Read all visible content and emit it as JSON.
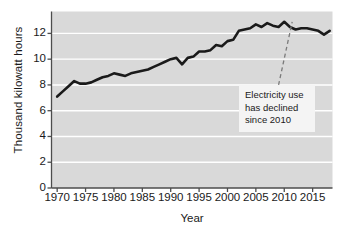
{
  "chart_data": {
    "type": "line",
    "title": "",
    "xlabel": "Year",
    "ylabel": "Thousand kilowatt hours",
    "xlim": [
      1969,
      2018.5
    ],
    "ylim": [
      0,
      13.7
    ],
    "grid": true,
    "legend": "none",
    "xticks": [
      1970,
      1975,
      1980,
      1985,
      1990,
      1995,
      2000,
      2005,
      2010,
      2015
    ],
    "xtick_labels": [
      "1970",
      "1975",
      "1980",
      "1985",
      "1990",
      "1995",
      "2000",
      "2005",
      "2010",
      "2015"
    ],
    "yticks": [
      0,
      2,
      4,
      6,
      8,
      10,
      12
    ],
    "ytick_labels": [
      "0",
      "2",
      "4",
      "6",
      "8",
      "10",
      "12"
    ],
    "series": [
      {
        "name": "Residential electricity use",
        "color": "#1a1a1a",
        "x": [
          1970,
          1971,
          1972,
          1973,
          1974,
          1975,
          1976,
          1977,
          1978,
          1979,
          1980,
          1981,
          1982,
          1983,
          1984,
          1985,
          1986,
          1987,
          1988,
          1989,
          1990,
          1991,
          1992,
          1993,
          1994,
          1995,
          1996,
          1997,
          1998,
          1999,
          2000,
          2001,
          2002,
          2003,
          2004,
          2005,
          2006,
          2007,
          2008,
          2009,
          2010,
          2011,
          2012,
          2013,
          2014,
          2015,
          2016,
          2017,
          2018
        ],
        "values": [
          7.1,
          7.5,
          7.9,
          8.3,
          8.1,
          8.1,
          8.2,
          8.4,
          8.6,
          8.7,
          8.9,
          8.8,
          8.7,
          8.9,
          9.0,
          9.1,
          9.2,
          9.4,
          9.6,
          9.8,
          10.0,
          10.1,
          9.6,
          10.1,
          10.2,
          10.6,
          10.6,
          10.7,
          11.1,
          11.0,
          11.4,
          11.5,
          12.2,
          12.3,
          12.4,
          12.7,
          12.5,
          12.8,
          12.6,
          12.5,
          12.9,
          12.5,
          12.3,
          12.4,
          12.4,
          12.3,
          12.2,
          11.9,
          12.2
        ]
      }
    ],
    "annotation": {
      "lines": [
        "Electricity use",
        "has declined",
        "since 2010"
      ],
      "pointer": {
        "from_x": 2009.0,
        "from_y": 8.0,
        "to_x": 2011.4,
        "to_y": 12.9,
        "style": "dashed"
      }
    },
    "style": {
      "plot_background": "#d9d9d9",
      "gridline_color": "#ffffff",
      "axis_color": "#4d4d4d",
      "line_color": "#1a1a1a",
      "line_width": 2.6,
      "annotation_background": "#f4f4f4"
    }
  }
}
